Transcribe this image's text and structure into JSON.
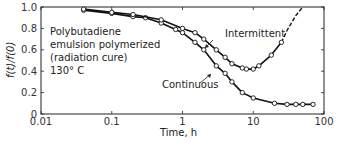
{
  "chart_data": {
    "type": "line",
    "title": "",
    "xlabel": "Time, h",
    "ylabel": "f(t)/f(0)",
    "xscale": "log",
    "xlim": [
      0.01,
      100
    ],
    "ylim": [
      0,
      1.0
    ],
    "x_ticks": [
      "0.01",
      "0.1",
      "1",
      "10",
      "100"
    ],
    "y_ticks": [
      "0",
      "0.2",
      "0.4",
      "0.6",
      "0.8",
      "1.0"
    ],
    "grid": false,
    "annotation_lines": [
      "Polybutadiene",
      "emulsion polymerized",
      "(radiation cure)",
      "130° C"
    ],
    "series": [
      {
        "name": "Continuous",
        "x": [
          0.04,
          0.1,
          0.2,
          0.3,
          0.5,
          0.8,
          1.0,
          1.5,
          2.0,
          3.0,
          4.0,
          5.0,
          7.0,
          10,
          20,
          30,
          40,
          50,
          70
        ],
        "values": [
          0.97,
          0.94,
          0.91,
          0.9,
          0.85,
          0.79,
          0.76,
          0.67,
          0.6,
          0.45,
          0.38,
          0.3,
          0.2,
          0.15,
          0.1,
          0.09,
          0.09,
          0.09,
          0.09
        ]
      },
      {
        "name": "Intermittent",
        "x": [
          0.04,
          0.1,
          0.2,
          0.5,
          1.0,
          1.5,
          2.0,
          3.0,
          4.0,
          5.0,
          7.0,
          8.0,
          10,
          12,
          18,
          25
        ],
        "values": [
          0.98,
          0.95,
          0.93,
          0.88,
          0.8,
          0.76,
          0.7,
          0.6,
          0.53,
          0.47,
          0.43,
          0.42,
          0.42,
          0.45,
          0.55,
          0.67
        ],
        "extrapolated_dashed": {
          "x": [
            25,
            30,
            40,
            50
          ],
          "values": [
            0.67,
            0.78,
            0.92,
            1.0
          ]
        }
      }
    ],
    "legend": "inline labels with arrows"
  },
  "labels": {
    "ylabel": "f(t)/f(0)",
    "xlabel": "Time, h",
    "continuous": "Continuous",
    "intermittent": "Intermittent",
    "anno1": "Polybutadiene",
    "anno2": "emulsion polymerized",
    "anno3": "(radiation cure)",
    "anno4": "130° C"
  }
}
